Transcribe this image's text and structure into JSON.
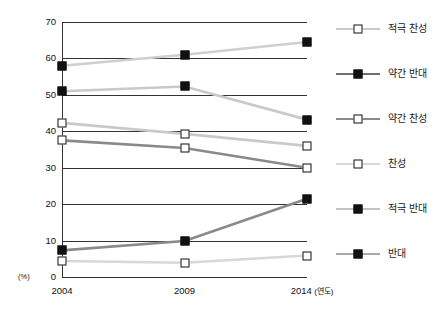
{
  "chart_data": {
    "type": "line",
    "title": "",
    "subtitle": "",
    "xlabel": "연도",
    "ylabel": "(%)",
    "x": [
      "2004",
      "2009",
      "2014"
    ],
    "categories": [
      "2004",
      "2009",
      "2014"
    ],
    "ylim": [
      0,
      70
    ],
    "yticks": [
      0,
      10,
      20,
      30,
      40,
      50,
      60,
      70
    ],
    "ytick_labels": [
      "0",
      "10",
      "20",
      "30",
      "40",
      "50",
      "60",
      "70"
    ],
    "xtick_labels": [
      "2004",
      "2009",
      "2014"
    ],
    "x_unit_note": "(연도)",
    "grid": true,
    "grid_axis": "y",
    "legend_position": "right",
    "series": [
      {
        "name": "적극 찬성",
        "marker": "open-square",
        "color": "#c9c9c9",
        "values": [
          42.3,
          39.3,
          36.0
        ]
      },
      {
        "name": "약간 반대",
        "marker": "filled-square",
        "color": "#c9c9c9",
        "values": [
          51.0,
          52.3,
          43.2
        ]
      },
      {
        "name": "약간 찬성",
        "marker": "open-square",
        "color": "#8a8a8a",
        "values": [
          37.5,
          35.4,
          30.0
        ]
      },
      {
        "name": "찬성",
        "marker": "open-square",
        "color": "#d8d8d8",
        "values": [
          4.4,
          3.9,
          5.9
        ]
      },
      {
        "name": "적극 반대",
        "marker": "filled-square",
        "color": "#cfcfcf",
        "values": [
          58.0,
          61.0,
          64.5
        ]
      },
      {
        "name": "반대",
        "marker": "filled-square",
        "color": "#8a8a8a",
        "values": [
          7.3,
          9.9,
          21.5
        ]
      }
    ],
    "legend": [
      {
        "label": "적극 찬성",
        "marker": "open-square",
        "color": "#c9c9c9"
      },
      {
        "label": "약간 반대",
        "marker": "filled-square",
        "color": "#6e6e6e"
      },
      {
        "label": "약간 찬성",
        "marker": "open-square",
        "color": "#8a8a8a"
      },
      {
        "label": "찬성",
        "marker": "open-square",
        "color": "#d8d8d8"
      },
      {
        "label": "적극 반대",
        "marker": "filled-square",
        "color": "#c3c3c3"
      },
      {
        "label": "반대",
        "marker": "filled-square",
        "color": "#a8a8a8"
      }
    ]
  }
}
